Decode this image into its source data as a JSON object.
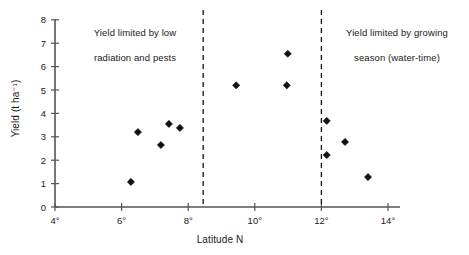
{
  "chart_data": {
    "type": "scatter",
    "title": "",
    "xlabel": "Latitude N",
    "ylabel": "Yield (t ha⁻¹)",
    "xlim": [
      4,
      14.5
    ],
    "ylim": [
      0,
      8
    ],
    "grid": false,
    "legend": "none",
    "x_tick_labels": [
      "4°",
      "6°",
      "8°",
      "10°",
      "12°",
      "14°"
    ],
    "x_tick_values": [
      4,
      6,
      8,
      10,
      12,
      14
    ],
    "y_tick_labels": [
      "0",
      "1",
      "2",
      "3",
      "4",
      "5",
      "6",
      "7",
      "8"
    ],
    "y_tick_values": [
      0,
      1,
      2,
      3,
      4,
      5,
      6,
      7,
      8
    ],
    "marker": "diamond",
    "marker_color": "#111111",
    "points": [
      {
        "x": 6.28,
        "y": 1.07
      },
      {
        "x": 6.49,
        "y": 3.2
      },
      {
        "x": 7.18,
        "y": 2.65
      },
      {
        "x": 7.42,
        "y": 3.55
      },
      {
        "x": 7.75,
        "y": 3.38
      },
      {
        "x": 9.44,
        "y": 5.2
      },
      {
        "x": 10.96,
        "y": 5.2
      },
      {
        "x": 10.99,
        "y": 6.55
      },
      {
        "x": 12.16,
        "y": 3.68
      },
      {
        "x": 12.16,
        "y": 2.22
      },
      {
        "x": 12.71,
        "y": 2.78
      },
      {
        "x": 13.4,
        "y": 1.28
      }
    ],
    "vlines": [
      {
        "x": 8.45,
        "style": "dashed"
      },
      {
        "x": 12.0,
        "style": "dashed"
      }
    ],
    "annotations": [
      {
        "name": "left",
        "text": "Yield limited by low\nradiation and pests",
        "x": 6.7,
        "y": 7.8
      },
      {
        "name": "right",
        "text": "Yield limited by growing\nseason (water-time)",
        "x": 13.0,
        "y": 7.8
      }
    ]
  },
  "axes": {
    "x_title": "Latitude N",
    "y_title": "Yield (t ha⁻¹)"
  },
  "annotations": {
    "left_line1": "Yield limited by low",
    "left_line2": "radiation and pests",
    "right_line1": "Yield limited by growing",
    "right_line2": "season (water-time)"
  },
  "colors": {
    "axis": "#555555",
    "marker": "#111111",
    "text": "#1a1a1a",
    "background": "#ffffff"
  }
}
